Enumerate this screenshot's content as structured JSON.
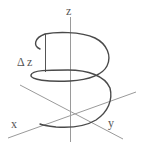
{
  "diagram": {
    "type": "3d-helix-with-axes",
    "labels": {
      "z_axis": "z",
      "x_axis": "x",
      "y_axis": "y",
      "pitch": "Δ z"
    },
    "colors": {
      "axes": "#8a8a8a",
      "helix": "#4a4a4a",
      "text": "#555555",
      "background": "#ffffff"
    }
  }
}
